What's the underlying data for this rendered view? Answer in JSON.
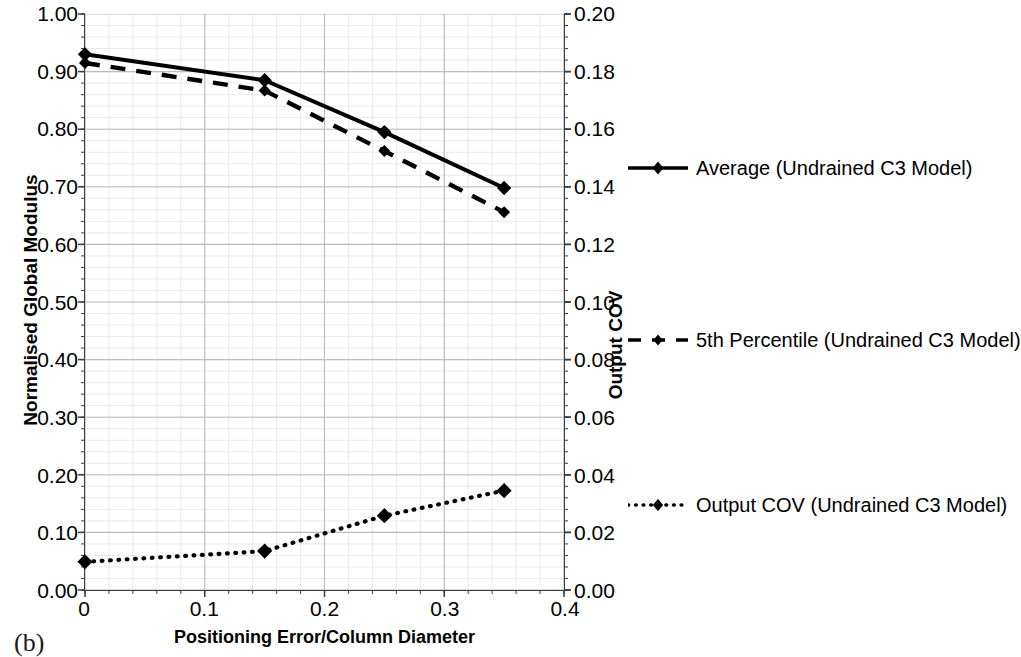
{
  "figure": {
    "panel_caption": "(b)"
  },
  "chart_data": {
    "type": "line",
    "title": "",
    "xlabel": "Positioning Error/Column Diameter",
    "ylabel": "Normalised Global Modulus",
    "y2label": "Output COV",
    "xlim": [
      0,
      0.4
    ],
    "ylim": [
      0.0,
      1.0
    ],
    "y2lim": [
      0.0,
      0.2
    ],
    "xticks": [
      "0",
      "0.1",
      "0.2",
      "0.3",
      "0.4"
    ],
    "xtick_values": [
      0,
      0.1,
      0.2,
      0.3,
      0.4
    ],
    "yticks": [
      "0.00",
      "0.10",
      "0.20",
      "0.30",
      "0.40",
      "0.50",
      "0.60",
      "0.70",
      "0.80",
      "0.90",
      "1.00"
    ],
    "ytick_values": [
      0.0,
      0.1,
      0.2,
      0.3,
      0.4,
      0.5,
      0.6,
      0.7,
      0.8,
      0.9,
      1.0
    ],
    "y2ticks": [
      "0.00",
      "0.02",
      "0.04",
      "0.06",
      "0.08",
      "0.10",
      "0.12",
      "0.14",
      "0.16",
      "0.18",
      "0.20"
    ],
    "y2tick_values": [
      0.0,
      0.02,
      0.04,
      0.06,
      0.08,
      0.1,
      0.12,
      0.14,
      0.16,
      0.18,
      0.2
    ],
    "grid": true,
    "minor_grid": true,
    "legend_position": "right",
    "x": [
      0,
      0.15,
      0.25,
      0.35
    ],
    "series": [
      {
        "name": "Average (Undrained C3 Model)",
        "axis": "left",
        "style": "solid",
        "marker": "diamond",
        "color": "#000000",
        "values": [
          0.93,
          0.885,
          0.795,
          0.698
        ]
      },
      {
        "name": "5th Percentile (Undrained C3 Model)",
        "axis": "left",
        "style": "dashed",
        "marker": "diamond",
        "color": "#000000",
        "values": [
          0.915,
          0.867,
          0.762,
          0.656
        ]
      },
      {
        "name": "Output COV (Undrained C3 Model)",
        "axis": "right",
        "style": "dotted",
        "marker": "diamond",
        "color": "#000000",
        "values": [
          0.0098,
          0.0135,
          0.0258,
          0.0345
        ]
      }
    ]
  }
}
